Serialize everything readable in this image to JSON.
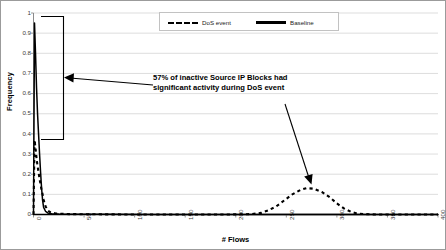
{
  "chart_data": {
    "type": "line",
    "title": "",
    "xlabel": "# Flows",
    "ylabel": "Frequency",
    "xlim": [
      0,
      400
    ],
    "ylim": [
      0,
      1
    ],
    "grid": true,
    "legend_position": "top-center",
    "x_ticks": [
      "0",
      "50",
      "100",
      "150",
      "200",
      "250",
      "300",
      "350",
      "400"
    ],
    "y_ticks": [
      "0",
      "0.1",
      "0.2",
      "0.3",
      "0.4",
      "0.5",
      "0.6",
      "0.7",
      "0.8",
      "0.9",
      "1"
    ],
    "series": [
      {
        "name": "Baseline",
        "style": "solid",
        "color": "#000000",
        "points": [
          [
            0,
            0.0
          ],
          [
            1,
            0.95
          ],
          [
            2,
            0.8
          ],
          [
            3,
            0.63
          ],
          [
            4,
            0.5
          ],
          [
            5,
            0.4
          ],
          [
            6,
            0.3
          ],
          [
            7,
            0.21
          ],
          [
            8,
            0.13
          ],
          [
            9,
            0.07
          ],
          [
            10,
            0.035
          ],
          [
            12,
            0.015
          ],
          [
            14,
            0.008
          ],
          [
            18,
            0.004
          ],
          [
            25,
            0.002
          ],
          [
            40,
            0.001
          ],
          [
            70,
            0.001
          ],
          [
            120,
            0.0
          ],
          [
            200,
            0.0
          ],
          [
            280,
            0.0
          ],
          [
            340,
            0.0
          ],
          [
            400,
            0.0
          ]
        ]
      },
      {
        "name": "DoS event",
        "style": "dashed",
        "color": "#000000",
        "points": [
          [
            0,
            0.0
          ],
          [
            1,
            0.37
          ],
          [
            2,
            0.33
          ],
          [
            3,
            0.28
          ],
          [
            4,
            0.24
          ],
          [
            5,
            0.21
          ],
          [
            6,
            0.175
          ],
          [
            7,
            0.15
          ],
          [
            8,
            0.12
          ],
          [
            9,
            0.1
          ],
          [
            10,
            0.075
          ],
          [
            11,
            0.055
          ],
          [
            12,
            0.04
          ],
          [
            14,
            0.02
          ],
          [
            17,
            0.01
          ],
          [
            22,
            0.005
          ],
          [
            35,
            0.002
          ],
          [
            60,
            0.001
          ],
          [
            100,
            0.0
          ],
          [
            150,
            0.0
          ],
          [
            190,
            0.0
          ],
          [
            215,
            0.002
          ],
          [
            225,
            0.008
          ],
          [
            232,
            0.02
          ],
          [
            240,
            0.04
          ],
          [
            248,
            0.07
          ],
          [
            256,
            0.1
          ],
          [
            264,
            0.122
          ],
          [
            270,
            0.131
          ],
          [
            277,
            0.128
          ],
          [
            285,
            0.112
          ],
          [
            293,
            0.085
          ],
          [
            300,
            0.055
          ],
          [
            307,
            0.03
          ],
          [
            314,
            0.013
          ],
          [
            320,
            0.005
          ],
          [
            328,
            0.002
          ],
          [
            340,
            0.0
          ],
          [
            360,
            0.0
          ],
          [
            400,
            0.0
          ]
        ]
      }
    ],
    "annotations": [
      {
        "name": "callout-text",
        "lines": [
          "57% of inactive Source IP Blocks had",
          "significant activity during DoS event"
        ]
      },
      {
        "name": "bracket",
        "description": "vertical bracket spanning frequency 0.39 to 0.95 near x=20",
        "y_top": 0.95,
        "y_bottom": 0.39
      }
    ]
  },
  "legend": {
    "entries": [
      {
        "label": "DoS event",
        "style": "dashed"
      },
      {
        "label": "Baseline",
        "style": "solid"
      }
    ]
  }
}
